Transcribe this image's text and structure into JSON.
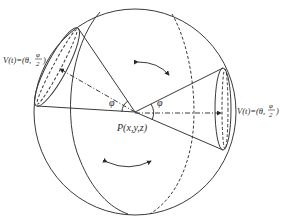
{
  "diagram": {
    "title": "",
    "labels": {
      "point_p": "P(x,y,z)",
      "left_cap_prefix": "V(t)=(θ,",
      "left_cap_num": "φ",
      "left_cap_den": "2",
      "left_cap_suffix": ")",
      "right_cap_prefix": "V(t)=(θ,",
      "right_cap_num": "φ",
      "right_cap_den": "2",
      "right_cap_suffix": ")",
      "angle_left": "φ",
      "angle_right": "φ"
    },
    "elements": [
      "sphere-outline",
      "solid-meridian",
      "dashed-meridian",
      "left-cone",
      "right-cone",
      "rotation-arrow-top",
      "rotation-arrow-bottom"
    ],
    "colors": {
      "ink": "#3a3a3a",
      "background": "#ffffff"
    }
  }
}
